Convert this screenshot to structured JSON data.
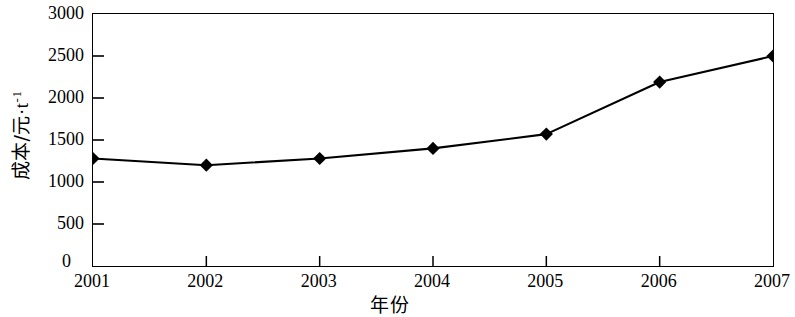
{
  "chart_data": {
    "type": "line",
    "title": "",
    "xlabel": "年份",
    "ylabel": "成本/元·t⁻¹",
    "ylabel_parts": {
      "base": "成本/元",
      "dot": "·",
      "unit": "t",
      "exponent": "-1"
    },
    "categories": [
      "2001",
      "2002",
      "2003",
      "2004",
      "2005",
      "2006",
      "2007"
    ],
    "x": [
      2001,
      2002,
      2003,
      2004,
      2005,
      2006,
      2007
    ],
    "values": [
      1280,
      1200,
      1280,
      1400,
      1570,
      2190,
      2500
    ],
    "series": [
      {
        "name": "成本",
        "values": [
          1280,
          1200,
          1280,
          1400,
          1570,
          2190,
          2500
        ]
      }
    ],
    "ylim": [
      0,
      3000
    ],
    "xlim": [
      2001,
      2007
    ],
    "yticks": [
      0,
      500,
      1000,
      1500,
      2000,
      2500,
      3000
    ],
    "ytick_labels": [
      "0",
      "500",
      "1000",
      "1500",
      "2000",
      "2500",
      "3000"
    ],
    "xticks": [
      2001,
      2002,
      2003,
      2004,
      2005,
      2006,
      2007
    ],
    "xtick_labels": [
      "2001",
      "2002",
      "2003",
      "2004",
      "2005",
      "2006",
      "2007"
    ],
    "grid": false,
    "legend": null,
    "legend_position": "none",
    "marker": "diamond",
    "line_color": "#000000",
    "marker_color": "#000000",
    "background_color": "#ffffff",
    "annotations": []
  }
}
